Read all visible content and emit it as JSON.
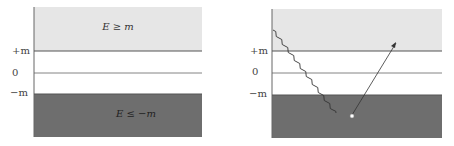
{
  "colors": {
    "positive_band": "#e6e6e6",
    "gap": "#ffffff",
    "negative_band": "#6e6e6e",
    "line": "#555555"
  },
  "left_panel": {
    "tick_plus": "+m",
    "tick_zero": "0",
    "tick_minus": "−m",
    "upper_label": "E ≥ m",
    "lower_label": "E ≤ −m"
  },
  "right_panel": {
    "tick_plus": "+m",
    "tick_zero": "0",
    "tick_minus": "−m",
    "photon": "wavy line incoming from upper-left into negative band",
    "electron": "arrow from hole up to positive band"
  }
}
